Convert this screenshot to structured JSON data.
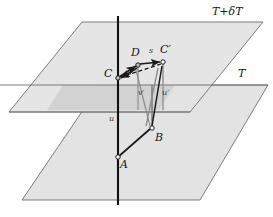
{
  "figure": {
    "kind": "geometric-diagram",
    "background_color": "#ffffff",
    "plane_fill_color": "#e3e3e3",
    "plane_overlap_fill_color": "#cfcfcf",
    "plane_edge_color": "#6e6e6e",
    "vector_color": "#1a1a1a",
    "guide_line_color": "#9a9a9a",
    "axis_color": "#111111"
  },
  "planes": [
    {
      "id": "upper-plane",
      "label": "T+δT",
      "label_x": 212,
      "label_y": 8,
      "outline": "82,22 263,22 190,112 9,112"
    },
    {
      "id": "lower-plane",
      "label": "T",
      "label_x": 238,
      "label_y": 72,
      "outline": "100,85 268,85 200,200 22,200"
    }
  ],
  "overlap_region": {
    "id": "plane-intersection-band",
    "outline": "63,85 175,85 159,110 47,110"
  },
  "axis": {
    "id": "vertical-axis",
    "x": 118,
    "y_top": 16,
    "y_bottom": 205
  },
  "points": [
    {
      "id": "C",
      "label": "C",
      "x": 118,
      "y": 78,
      "label_x": 104,
      "label_y": 68
    },
    {
      "id": "D",
      "label": "D",
      "x": 138,
      "y": 65,
      "label_x": 131,
      "label_y": 48
    },
    {
      "id": "Cp",
      "label": "C′",
      "x": 163,
      "y": 62,
      "label_x": 160,
      "label_y": 45
    },
    {
      "id": "B",
      "label": "B",
      "x": 152,
      "y": 128,
      "label_x": 155,
      "label_y": 133
    },
    {
      "id": "A",
      "label": "A",
      "x": 118,
      "y": 157,
      "label_x": 120,
      "label_y": 160
    }
  ],
  "segment_labels": [
    {
      "id": "s-label",
      "label": "s",
      "x": 150,
      "y": 48
    },
    {
      "id": "u-label",
      "label": "u",
      "x": 110,
      "y": 118
    },
    {
      "id": "vp-label",
      "label": "v′",
      "x": 139,
      "y": 92
    },
    {
      "id": "up-label",
      "label": "u′",
      "x": 163,
      "y": 92
    }
  ],
  "edges": [
    {
      "id": "A-to-B",
      "from": "A",
      "to": "B",
      "style": "solid-arrow"
    },
    {
      "id": "B-to-Cp",
      "from": "B",
      "to": "Cp",
      "style": "solid-arrow"
    },
    {
      "id": "C-to-D",
      "from": "C",
      "to": "D",
      "style": "solid-arrow"
    },
    {
      "id": "D-to-Cp",
      "from": "D",
      "to": "Cp",
      "style": "solid-arrow"
    },
    {
      "id": "Cp-to-C",
      "from": "Cp",
      "to": "C",
      "style": "dashed-arrow"
    },
    {
      "id": "D-to-C",
      "from": "D",
      "to": "C",
      "style": "solid-arrow"
    }
  ],
  "guide_lines": [
    {
      "id": "guide-Cp-drop",
      "x": 163,
      "y_top": 62,
      "y_bottom": 110
    },
    {
      "id": "guide-D-drop",
      "x": 138,
      "y_top": 65,
      "y_bottom": 110
    },
    {
      "id": "guide-B-rise",
      "x": 152,
      "y_top": 85,
      "y_bottom": 128
    }
  ]
}
